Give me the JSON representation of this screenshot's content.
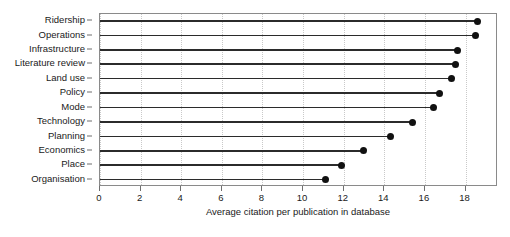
{
  "chart_data": {
    "type": "bar",
    "subtype": "lollipop-horizontal",
    "title": "",
    "subtitle": "",
    "xlabel": "Average citation per publication in database",
    "ylabel": "",
    "categories": [
      "Ridership",
      "Operations",
      "Infrastructure",
      "Literature review",
      "Land use",
      "Policy",
      "Mode",
      "Technology",
      "Planning",
      "Economics",
      "Place",
      "Organisation"
    ],
    "values": [
      18.6,
      18.5,
      17.6,
      17.5,
      17.3,
      16.7,
      16.4,
      15.4,
      14.3,
      13.0,
      11.9,
      11.1
    ],
    "xlim": [
      0,
      19.6
    ],
    "ylim": [
      0,
      12
    ],
    "xticks": [
      0,
      2,
      4,
      6,
      8,
      10,
      12,
      14,
      16,
      18
    ],
    "xtick_labels": [
      "0",
      "2",
      "4",
      "6",
      "8",
      "10",
      "12",
      "14",
      "16",
      "18"
    ],
    "grid": {
      "x": true,
      "y": false,
      "style": "dotted",
      "color": "#c9c9c9"
    },
    "legend": {
      "visible": false,
      "position": "none",
      "entries": []
    },
    "colors": {
      "stem": "#2b2b2b",
      "marker": "#111111",
      "frame": "#8a8a8a",
      "gridline": "#c9c9c9",
      "text": "#1a1a1a",
      "background": "#ffffff"
    },
    "marker": {
      "shape": "circle",
      "size": 7
    },
    "orientation": "horizontal",
    "baseline": 0
  }
}
